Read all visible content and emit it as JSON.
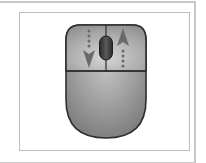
{
  "figure": {
    "icons": {
      "mouse": "mouse-icon",
      "scroll_wheel": "scroll-wheel-icon",
      "scroll_down_arrow": "arrow-down-dotted-icon",
      "scroll_up_arrow": "arrow-up-dotted-icon"
    },
    "colors": {
      "frame_border": "#c8c8c8",
      "panel_border": "#bdbdbd",
      "mouse_body": "#9a9a9a",
      "mouse_highlight": "#c9c9c9",
      "mouse_outline": "#2e2e2e",
      "button_area": "#a8a8a8",
      "wheel": "#3a3a3a",
      "arrow": "#6a6a6a"
    }
  }
}
